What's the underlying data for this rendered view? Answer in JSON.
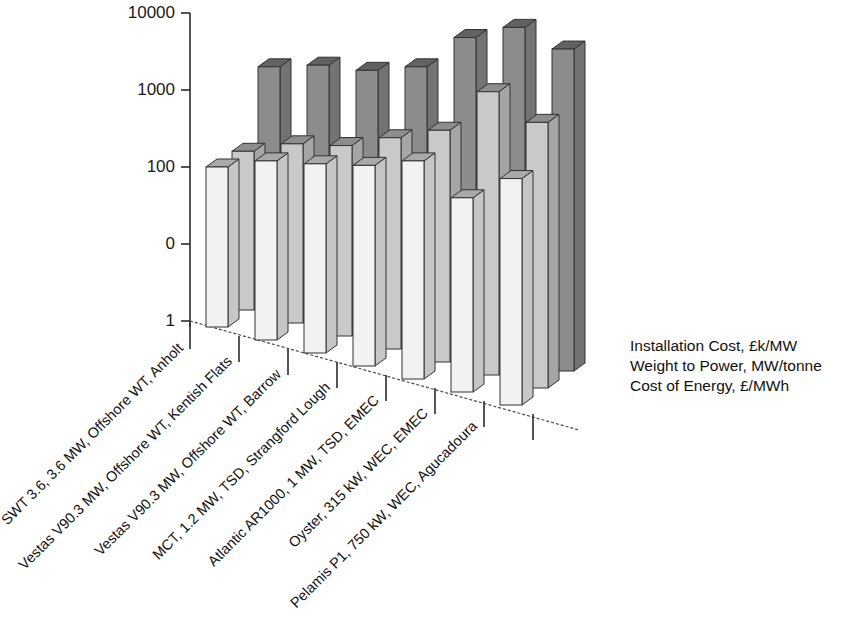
{
  "chart_data": {
    "type": "bar",
    "title": "",
    "subtitle": "",
    "xlabel": "",
    "ylabel": "",
    "grid": false,
    "three_d": true,
    "legend_position": "right",
    "y_ticks": [
      "10000",
      "1000",
      "100",
      "0",
      "1"
    ],
    "ylim": [
      1,
      10000
    ],
    "categories": [
      "SWT 3.6, 3.6 MW, Offshore WT, Anholt",
      "Vestas V90.3 MW, Offshore WT, Kentish Flats",
      "Vestas V90.3 MW, Offshore WT, Barrow",
      "MCT, 1.2 MW, TSD, Strangford Lough",
      "Atlantic AR1000, 1 MW, TSD, EMEC",
      "Oyster, 315 kW, WEC, EMEC",
      "Pelamis P1, 750 kW, WEC, Agucadoura"
    ],
    "series": [
      {
        "name": "Installation Cost, £k/MW",
        "color": "#f2f2f0",
        "values": [
          100,
          120,
          110,
          105,
          120,
          60,
          85
        ]
      },
      {
        "name": "Weight to Power, MW/tonne",
        "color": "#c9c9c7",
        "values": [
          160,
          200,
          190,
          240,
          300,
          950,
          380
        ]
      },
      {
        "name": "Cost of Energy, £/MWh",
        "color": "#8c8c8a",
        "values": [
          2000,
          2100,
          1800,
          2000,
          4800,
          6500,
          3400
        ]
      }
    ]
  },
  "legend": {
    "entries": [
      "Installation Cost, £k/MW",
      "Weight to Power, MW/tonne",
      "Cost of Energy, £/MWh"
    ]
  }
}
